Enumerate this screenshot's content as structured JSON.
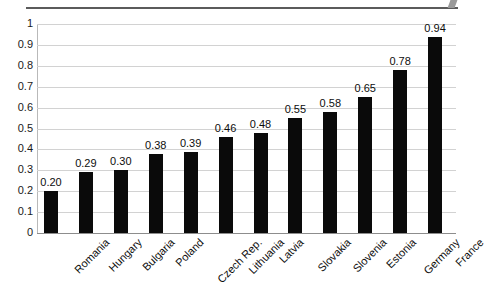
{
  "chart_data": {
    "type": "bar",
    "title": "",
    "subtitle": "",
    "xlabel": "",
    "ylabel": "",
    "orientation": "vertical",
    "grid": true,
    "legend": false,
    "ylim": [
      0,
      1
    ],
    "y_ticks": [
      "0",
      "0.1",
      "0.2",
      "0.3",
      "0.4",
      "0.5",
      "0.6",
      "0.7",
      "0.8",
      "0.9",
      "1"
    ],
    "y_tick_values": [
      0,
      0.1,
      0.2,
      0.3,
      0.4,
      0.5,
      0.6,
      0.7,
      0.8,
      0.9,
      1
    ],
    "bar_color": "#0a0a0a",
    "gridline_color": "#d2d2d2",
    "background_color": "#ffffff",
    "categories": [
      "Romania",
      "Hungary",
      "Bulgaria",
      "Poland",
      "Czech Rep.",
      "Lithuania",
      "Latvia",
      "Slovakia",
      "Slovenia",
      "Estonia",
      "Germany",
      "France"
    ],
    "values": [
      0.2,
      0.29,
      0.3,
      0.38,
      0.39,
      0.46,
      0.48,
      0.55,
      0.58,
      0.65,
      0.78,
      0.94
    ],
    "data_labels": [
      "0.20",
      "0.29",
      "0.30",
      "0.38",
      "0.39",
      "0.46",
      "0.48",
      "0.55",
      "0.58",
      "0.65",
      "0.78",
      "0.94"
    ],
    "points": [
      {
        "category": "Romania",
        "value": 0.2,
        "label": "0.20"
      },
      {
        "category": "Hungary",
        "value": 0.29,
        "label": "0.29"
      },
      {
        "category": "Bulgaria",
        "value": 0.3,
        "label": "0.30"
      },
      {
        "category": "Poland",
        "value": 0.38,
        "label": "0.38"
      },
      {
        "category": "Czech Rep.",
        "value": 0.39,
        "label": "0.39"
      },
      {
        "category": "Lithuania",
        "value": 0.46,
        "label": "0.46"
      },
      {
        "category": "Latvia",
        "value": 0.48,
        "label": "0.48"
      },
      {
        "category": "Slovakia",
        "value": 0.55,
        "label": "0.55"
      },
      {
        "category": "Slovenia",
        "value": 0.58,
        "label": "0.58"
      },
      {
        "category": "Estonia",
        "value": 0.65,
        "label": "0.65"
      },
      {
        "category": "Germany",
        "value": 0.78,
        "label": "0.78"
      },
      {
        "category": "France",
        "value": 0.94,
        "label": "0.94"
      }
    ]
  }
}
